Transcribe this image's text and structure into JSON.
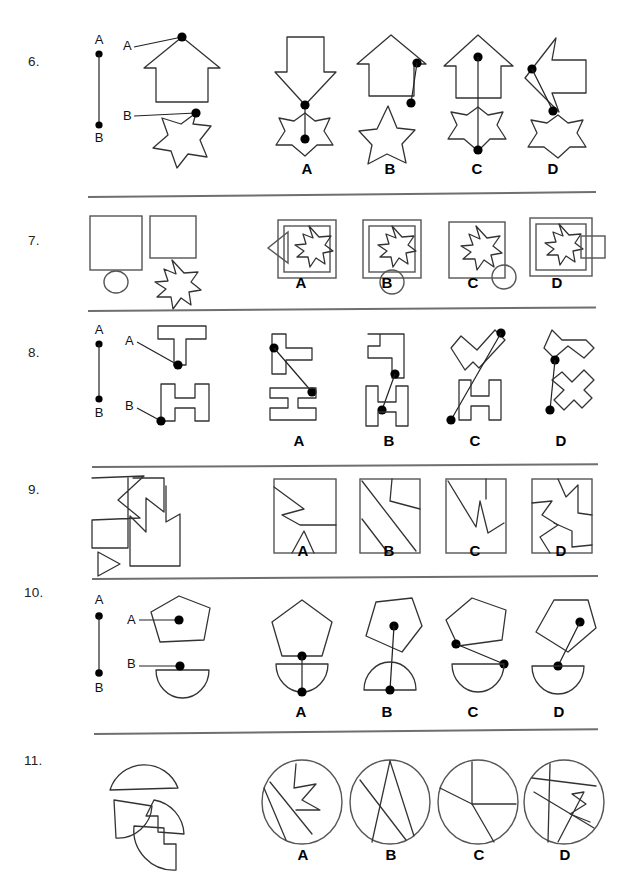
{
  "page": {
    "kind": "spatial-reasoning-worksheet",
    "width": 619,
    "height": 881,
    "ink_color": "#333333",
    "rule_color": "#6f6f6f"
  },
  "option_letters": [
    "A",
    "B",
    "C",
    "D"
  ],
  "point_labels": {
    "a": "A",
    "b": "B"
  },
  "questions": [
    {
      "number": "6.",
      "type": "dot-connection",
      "prompt": {
        "reference_line": {
          "top_label": "A",
          "bottom_label": "B"
        },
        "shapes": [
          "arrow-up",
          "star-6"
        ],
        "markers": [
          {
            "label": "A",
            "on": "arrow-up",
            "position": "apex"
          },
          {
            "label": "B",
            "on": "star-6",
            "position": "upper-right-point"
          }
        ]
      },
      "options": [
        {
          "letter": "A",
          "shapes": [
            "arrow-down",
            "star-6"
          ]
        },
        {
          "letter": "B",
          "shapes": [
            "arrow-up",
            "star-5"
          ]
        },
        {
          "letter": "C",
          "shapes": [
            "arrow-up",
            "star-6"
          ]
        },
        {
          "letter": "D",
          "shapes": [
            "arrow-left",
            "star-6"
          ]
        }
      ]
    },
    {
      "number": "7.",
      "type": "shape-overlay",
      "prompt": {
        "shapes": [
          "square-large",
          "square-small",
          "circle",
          "star-8"
        ]
      },
      "options": [
        {
          "letter": "A",
          "shapes": [
            "square-outer",
            "square-inner",
            "star-8",
            "triangle-left"
          ]
        },
        {
          "letter": "B",
          "shapes": [
            "square-outer",
            "square-inner",
            "star-8",
            "circle-bottom"
          ]
        },
        {
          "letter": "C",
          "shapes": [
            "square-single",
            "star-8",
            "circle-corner"
          ]
        },
        {
          "letter": "D",
          "shapes": [
            "square-outer",
            "square-inner",
            "star-8",
            "rect-right"
          ]
        }
      ]
    },
    {
      "number": "8.",
      "type": "dot-connection",
      "prompt": {
        "reference_line": {
          "top_label": "A",
          "bottom_label": "B"
        },
        "shapes": [
          "letter-T",
          "letter-H"
        ],
        "markers": [
          {
            "label": "A",
            "on": "letter-T",
            "position": "stem-bottom"
          },
          {
            "label": "B",
            "on": "letter-H",
            "position": "lower-left"
          }
        ]
      },
      "options": [
        {
          "letter": "A",
          "shapes": [
            "letter-T-rotated",
            "letter-I"
          ]
        },
        {
          "letter": "B",
          "shapes": [
            "letter-T-rotated",
            "letter-H"
          ]
        },
        {
          "letter": "C",
          "shapes": [
            "letter-T-tilted",
            "letter-H"
          ]
        },
        {
          "letter": "D",
          "shapes": [
            "letter-T-tilted",
            "letter-H-tilted"
          ]
        }
      ]
    },
    {
      "number": "9.",
      "type": "piece-assembly",
      "prompt": {
        "shapes": [
          "polygon-piece-1",
          "polygon-piece-2",
          "triangle-piece"
        ]
      },
      "options": [
        {
          "letter": "A",
          "shapes": [
            "rectangle-with-cuts"
          ]
        },
        {
          "letter": "B",
          "shapes": [
            "rectangle-with-cuts"
          ]
        },
        {
          "letter": "C",
          "shapes": [
            "rectangle-with-cuts"
          ]
        },
        {
          "letter": "D",
          "shapes": [
            "rectangle-with-cuts"
          ]
        }
      ]
    },
    {
      "number": "10.",
      "type": "dot-connection",
      "prompt": {
        "reference_line": {
          "top_label": "A",
          "bottom_label": "B"
        },
        "shapes": [
          "pentagon",
          "semicircle"
        ],
        "markers": [
          {
            "label": "A",
            "on": "pentagon",
            "position": "center"
          },
          {
            "label": "B",
            "on": "semicircle",
            "position": "flat-edge-center"
          }
        ]
      },
      "options": [
        {
          "letter": "A",
          "shapes": [
            "pentagon",
            "semicircle-down"
          ]
        },
        {
          "letter": "B",
          "shapes": [
            "pentagon-tilted",
            "semicircle-up"
          ]
        },
        {
          "letter": "C",
          "shapes": [
            "pentagon-tilted",
            "semicircle-down"
          ]
        },
        {
          "letter": "D",
          "shapes": [
            "pentagon",
            "semicircle-down"
          ]
        }
      ]
    },
    {
      "number": "11.",
      "type": "piece-assembly",
      "prompt": {
        "shapes": [
          "arc-piece-1",
          "arc-piece-2",
          "arc-piece-3",
          "arc-piece-4"
        ]
      },
      "options": [
        {
          "letter": "A",
          "shapes": [
            "circle-with-cuts"
          ]
        },
        {
          "letter": "B",
          "shapes": [
            "circle-with-cuts"
          ]
        },
        {
          "letter": "C",
          "shapes": [
            "circle-with-cuts"
          ]
        },
        {
          "letter": "D",
          "shapes": [
            "circle-with-cuts"
          ]
        }
      ]
    }
  ]
}
